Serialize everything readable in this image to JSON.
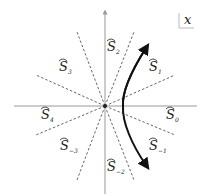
{
  "diagram": {
    "corner_label": "x",
    "sectors": [
      {
        "id": "S0",
        "label": "S",
        "sub": "0"
      },
      {
        "id": "S1",
        "label": "S",
        "sub": "1"
      },
      {
        "id": "S2",
        "label": "S",
        "sub": "2"
      },
      {
        "id": "S3",
        "label": "S",
        "sub": "3"
      },
      {
        "id": "S4",
        "label": "S",
        "sub": "4"
      },
      {
        "id": "S-3",
        "label": "S",
        "sub": "−3"
      },
      {
        "id": "S-2",
        "label": "S",
        "sub": "−2"
      },
      {
        "id": "S-1",
        "label": "S",
        "sub": "−1"
      }
    ],
    "colors": {
      "axis": "#999999",
      "dash": "#555555",
      "curve": "#111111"
    }
  }
}
